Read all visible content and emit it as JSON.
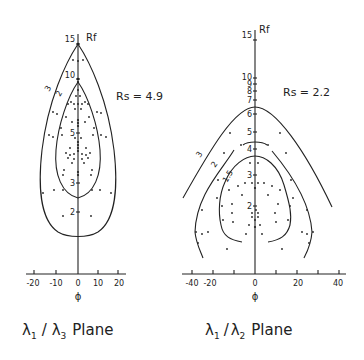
{
  "figure": {
    "panels": [
      {
        "id": "left",
        "title": {
          "lambda_a": "λ",
          "sub_a": "1",
          "sep": "/",
          "lambda_b": "λ",
          "sub_b": "3",
          "suffix": "Plane"
        },
        "y_axis_label": "Rf",
        "x_axis_label": "ϕ",
        "rs_label": "Rs = 4.9",
        "y_ticks": [
          "15",
          "10",
          "5",
          "3",
          "2"
        ],
        "x_ticks": [
          "-20",
          "-10",
          "0",
          "10",
          "20"
        ],
        "curve_labels": [
          "3",
          "2"
        ]
      },
      {
        "id": "right",
        "title": {
          "lambda_a": "λ",
          "sub_a": "1",
          "sep": "/",
          "lambda_b": "λ",
          "sub_b": "2",
          "suffix": "Plane"
        },
        "y_axis_label": "Rf",
        "x_axis_label": "ϕ",
        "rs_label": "Rs = 2.2",
        "y_ticks": [
          "15",
          "10",
          "9",
          "8",
          "7",
          "6",
          "5",
          "4",
          "3",
          "2"
        ],
        "x_ticks": [
          "-40",
          "-20",
          "0",
          "20",
          "40"
        ],
        "curve_labels": [
          "3",
          "2",
          "1.5"
        ]
      }
    ]
  },
  "colors": {
    "ink": "#222222",
    "background": "#ffffff"
  }
}
